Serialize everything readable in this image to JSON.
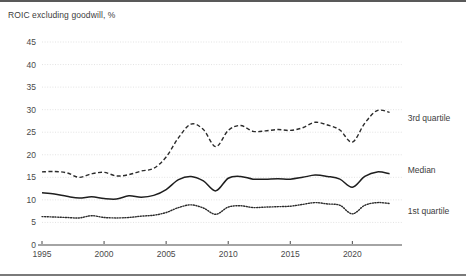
{
  "figure": {
    "title": "ROIC excluding goodwill, %"
  },
  "chart_data": {
    "type": "line",
    "title": "ROIC excluding goodwill, %",
    "xlabel": "",
    "ylabel": "",
    "xlim": [
      1995,
      2024
    ],
    "ylim": [
      0,
      45
    ],
    "grid": true,
    "grid_axis": "y",
    "legend_position": "right-inline",
    "yticks": [
      0,
      5,
      10,
      15,
      20,
      25,
      30,
      35,
      40,
      45
    ],
    "ytick_labels": [
      "0",
      "5",
      "10",
      "15",
      "20",
      "25",
      "30",
      "35",
      "40",
      "45"
    ],
    "xticks": [
      1995,
      2000,
      2005,
      2010,
      2015,
      2020
    ],
    "xtick_labels": [
      "1995",
      "2000",
      "2005",
      "2010",
      "2015",
      "2020"
    ],
    "x": [
      1995,
      1996,
      1997,
      1998,
      1999,
      2000,
      2001,
      2002,
      2003,
      2004,
      2005,
      2006,
      2007,
      2008,
      2009,
      2010,
      2011,
      2012,
      2013,
      2014,
      2015,
      2016,
      2017,
      2018,
      2019,
      2020,
      2021,
      2022,
      2023
    ],
    "series": [
      {
        "name": "3rd quartile",
        "style": "dashed",
        "color": "#2b2b2b",
        "label_x": 2024.3,
        "label_y": 28.2,
        "values": [
          16.2,
          16.3,
          16.0,
          15.0,
          15.8,
          16.1,
          15.3,
          15.6,
          16.4,
          17.0,
          19.5,
          23.8,
          26.8,
          25.6,
          21.8,
          25.4,
          26.5,
          25.2,
          25.3,
          25.6,
          25.4,
          26.0,
          27.2,
          26.6,
          25.5,
          22.8,
          27.0,
          29.8,
          29.4
        ]
      },
      {
        "name": "Median",
        "style": "solid",
        "color": "#1e1e1e",
        "label_x": 2024.3,
        "label_y": 16.6,
        "values": [
          11.6,
          11.3,
          10.8,
          10.4,
          10.7,
          10.3,
          10.2,
          10.9,
          10.6,
          11.0,
          12.3,
          14.5,
          15.2,
          14.2,
          12.0,
          14.8,
          15.2,
          14.6,
          14.6,
          14.7,
          14.6,
          15.0,
          15.5,
          15.2,
          14.6,
          12.8,
          15.2,
          16.2,
          15.8
        ]
      },
      {
        "name": "1st quartile",
        "style": "dotted",
        "color": "#2b2b2b",
        "label_x": 2024.3,
        "label_y": 7.6,
        "values": [
          6.3,
          6.2,
          6.1,
          6.0,
          6.5,
          6.1,
          6.0,
          6.1,
          6.4,
          6.6,
          7.2,
          8.3,
          8.9,
          8.2,
          6.8,
          8.4,
          8.7,
          8.3,
          8.4,
          8.5,
          8.6,
          9.0,
          9.4,
          9.1,
          8.8,
          6.9,
          8.8,
          9.4,
          9.2
        ]
      }
    ]
  }
}
